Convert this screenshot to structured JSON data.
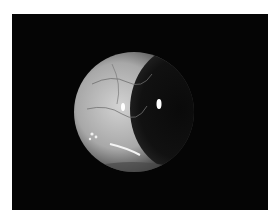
{
  "image": {
    "subject": "slit-lamp photograph of an eye showing a crescent-shaped illuminated sclera and iris",
    "background_color": "#050505",
    "page_background": "#ffffff",
    "eye_color": "#bdbdbd"
  }
}
